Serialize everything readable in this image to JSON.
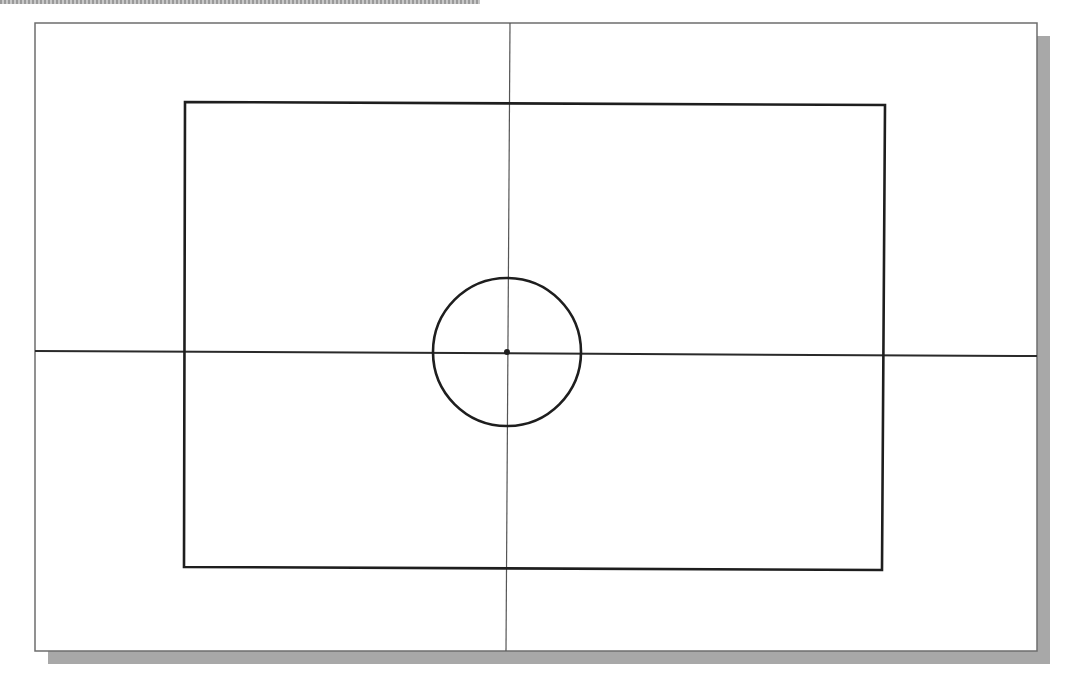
{
  "diagram": {
    "colors": {
      "background": "#ffffff",
      "frame_border": "#6e6e6e",
      "shadow": "#a8a8a8",
      "shape_stroke": "#1e1e1e",
      "centerline_stroke": "#555555",
      "top_band": "#9a9a9a"
    },
    "frame": {
      "left": 35,
      "top": 23,
      "right": 1037,
      "bottom": 651,
      "shadow_offset": 13
    },
    "rectangle": {
      "top_left": [
        185,
        102
      ],
      "top_right": [
        885,
        105
      ],
      "bottom_right": [
        882,
        570
      ],
      "bottom_left": [
        184,
        567
      ]
    },
    "circle": {
      "cx": 507,
      "cy": 352,
      "r": 74,
      "center_point_radius": 3
    },
    "horizontal_centerline": {
      "x1": 35,
      "y1": 351,
      "x2": 1037,
      "y2": 356
    },
    "vertical_centerline": {
      "x1": 510,
      "y1": 23,
      "x2": 506,
      "y2": 651
    }
  }
}
